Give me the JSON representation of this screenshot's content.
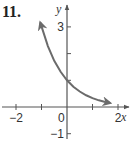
{
  "problem_number": "11.",
  "chart_data": {
    "type": "line",
    "title": "",
    "xlabel": "x",
    "ylabel": "y",
    "xlim": [
      -2.6,
      2.6
    ],
    "ylim": [
      -1.4,
      3.9
    ],
    "x_ticks": [
      -2,
      -1,
      0,
      1,
      2
    ],
    "x_tick_labels": [
      {
        "value": -2,
        "label": "−2"
      },
      {
        "value": 0,
        "label": "0"
      },
      {
        "value": 2,
        "label": "2"
      }
    ],
    "y_ticks": [
      -1,
      1,
      2,
      3
    ],
    "y_tick_labels": [
      {
        "value": 3,
        "label": "3"
      },
      {
        "value": -1,
        "label": "−1"
      }
    ],
    "grid": false,
    "series": [
      {
        "name": "y = 3^(-x)",
        "function": "3^(-x)",
        "x_range": [
          -1.05,
          1.7
        ],
        "points": [
          [
            -1.05,
            3.17
          ],
          [
            -0.75,
            2.28
          ],
          [
            -0.5,
            1.73
          ],
          [
            -0.25,
            1.32
          ],
          [
            0,
            1
          ],
          [
            0.25,
            0.76
          ],
          [
            0.5,
            0.58
          ],
          [
            0.75,
            0.44
          ],
          [
            1,
            0.33
          ],
          [
            1.25,
            0.25
          ],
          [
            1.5,
            0.19
          ],
          [
            1.7,
            0.15
          ]
        ],
        "arrows": "both",
        "color": "#6b6b6b"
      }
    ],
    "axis_color": "#555555"
  }
}
